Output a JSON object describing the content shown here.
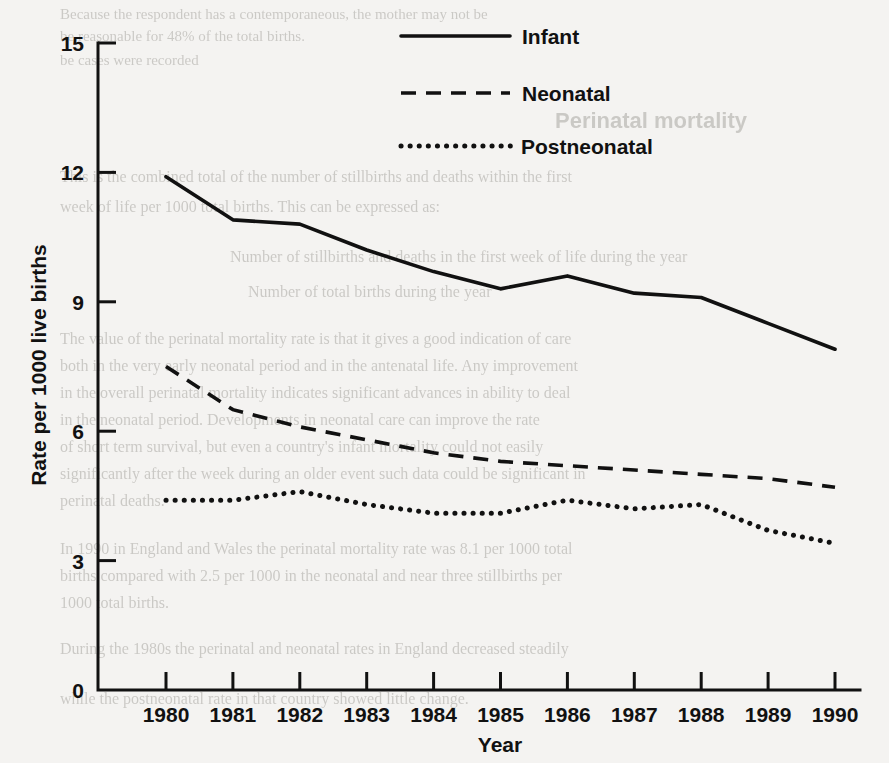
{
  "chart_data": {
    "type": "line",
    "title": "",
    "xlabel": "Year",
    "ylabel": "Rate per 1000 live births",
    "x": [
      1980,
      1981,
      1982,
      1983,
      1984,
      1985,
      1986,
      1987,
      1988,
      1989,
      1990
    ],
    "x_tick_labels": [
      "1980",
      "1981",
      "1982",
      "1983",
      "1984",
      "1985",
      "1986",
      "1987",
      "1988",
      "1989",
      "1990"
    ],
    "y_tick_labels": [
      "0",
      "3",
      "6",
      "9",
      "12",
      "15"
    ],
    "y_ticks": [
      0,
      3,
      6,
      9,
      12,
      15
    ],
    "ylim": [
      0,
      15
    ],
    "xlim": [
      1980,
      1990
    ],
    "grid": false,
    "legend_position": "top-center",
    "series": [
      {
        "name": "Infant",
        "style": "solid",
        "color": "#111111",
        "values": [
          11.9,
          10.9,
          10.8,
          10.2,
          9.7,
          9.3,
          9.6,
          9.2,
          9.1,
          8.5,
          7.9
        ]
      },
      {
        "name": "Neonatal",
        "style": "dashed",
        "color": "#111111",
        "values": [
          7.5,
          6.5,
          6.1,
          5.8,
          5.5,
          5.3,
          5.2,
          5.1,
          5.0,
          4.9,
          4.7
        ]
      },
      {
        "name": "Postneonatal",
        "style": "dotted",
        "color": "#111111",
        "values": [
          4.4,
          4.4,
          4.6,
          4.3,
          4.1,
          4.1,
          4.4,
          4.2,
          4.3,
          3.7,
          3.4
        ]
      }
    ]
  },
  "legend": {
    "items": [
      {
        "label": "Infant",
        "style": "solid"
      },
      {
        "label": "Neonatal",
        "style": "dashed"
      },
      {
        "label": "Postneonatal",
        "style": "dotted"
      }
    ]
  },
  "ghost_text": {
    "lines": [
      "Because the respondent has a contemporaneous, the mother may not be",
      "be reasonable for 48% of the total births.",
      "be cases were recorded",
      "Perinatal mortality",
      "This is the combined total of the number of stillbirths and deaths within the first",
      "week of life per 1000 total births. This can be expressed as:",
      "Number of stillbirths and deaths in the first week of life during the year",
      "Number of total births during the year",
      "The value of the perinatal mortality rate is that it gives a good indication of care",
      "both in the very early neonatal period and in the antenatal life. Any improvement",
      "in the overall perinatal mortality indicates significant advances in ability to deal",
      "in the neonatal period. Developments in neonatal care can improve the rate",
      "of short term survival, but even a country's infant mortality could not easily",
      "significantly after the week during an older event such data could be significant in",
      "perinatal deaths.",
      "In 1990 in England and Wales the perinatal mortality rate was 8.1 per 1000 total",
      "births compared with 2.5 per 1000 in the neonatal and near three stillbirths per",
      "1000 total births.",
      "During the 1980s the perinatal and neonatal rates in England decreased steadily",
      "while the postneonatal rate in that country showed little change."
    ]
  }
}
